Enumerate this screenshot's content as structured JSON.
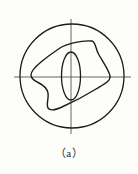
{
  "figure": {
    "caption": "（a）",
    "caption_plain": "( a )",
    "type": "engineering-sketch",
    "colors": {
      "background": "#fdfdfc",
      "outline": "#1c1c1c",
      "centerline": "#555555",
      "caption_text": "#2b2b2b"
    },
    "elements": {
      "circle": {
        "name": "outer-circle",
        "cx": 72,
        "cy": 76,
        "r": 52,
        "stroke_width": 1.3
      },
      "centerline_horizontal": {
        "name": "horizontal-centerline",
        "x1": 14,
        "y1": 77,
        "x2": 131,
        "y2": 77,
        "stroke_width": 0.9
      },
      "centerline_vertical": {
        "name": "vertical-centerline",
        "x1": 71,
        "y1": 19,
        "x2": 71,
        "y2": 134,
        "stroke_width": 0.9
      },
      "blob": {
        "name": "irregular-quadrilateral-outline",
        "path": "M 60,48 C 66,44 82,40 92,41 C 96,42 95,48 99,55 C 103,62 109,70 110,76 C 111,81 104,84 96,89 C 88,94 73,102 64,106 C 56,110 50,111 48,108 C 46,104 49,98 48,93 C 47,88 43,85 39,83 C 35,81 31,79 31,75 C 31,71 35,67 41,62 C 47,57 54,52 60,48 Z",
        "stroke_width": 1.4
      },
      "ellipse": {
        "name": "center-ellipse",
        "cx": 71,
        "cy": 76,
        "rx": 9.5,
        "ry": 24,
        "stroke_width": 1.3
      }
    }
  }
}
